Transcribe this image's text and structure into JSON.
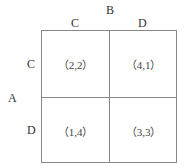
{
  "diagram": {
    "player_row": "A",
    "player_col": "B",
    "col_strategies": [
      "C",
      "D"
    ],
    "row_strategies": [
      "C",
      "D"
    ],
    "payoffs": [
      [
        "（2,2）",
        "（4,1）"
      ],
      [
        "（1,4）",
        "（3,3）"
      ]
    ]
  }
}
